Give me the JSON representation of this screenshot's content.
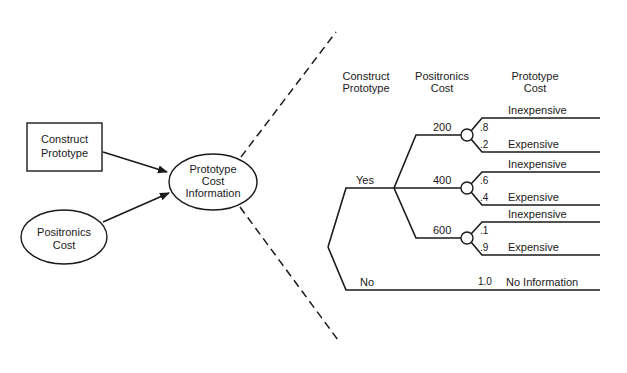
{
  "influence_diagram": {
    "decision_node": {
      "label_line1": "Construct",
      "label_line2": "Prototype"
    },
    "uncertainty_node_positronics": {
      "label_line1": "Positronics",
      "label_line2": "Cost"
    },
    "uncertainty_node_info": {
      "label_line1": "Prototype",
      "label_line2": "Cost",
      "label_line3": "Information"
    }
  },
  "decision_tree": {
    "headers": {
      "construct_prototype": {
        "line1": "Construct",
        "line2": "Prototype"
      },
      "positronics_cost": {
        "line1": "Positronics",
        "line2": "Cost"
      },
      "prototype_cost": {
        "line1": "Prototype",
        "line2": "Cost"
      }
    },
    "construct_branches": [
      {
        "label": "Yes"
      },
      {
        "label": "No"
      }
    ],
    "positronics_branches": [
      {
        "cost": "200",
        "outcomes": [
          {
            "prob": ".8",
            "label": "Inexpensive"
          },
          {
            "prob": ".2",
            "label": "Expensive"
          }
        ]
      },
      {
        "cost": "400",
        "outcomes": [
          {
            "prob": ".6",
            "label": "Inexpensive"
          },
          {
            "prob": ".4",
            "label": "Expensive"
          }
        ]
      },
      {
        "cost": "600",
        "outcomes": [
          {
            "prob": ".1",
            "label": "Inexpensive"
          },
          {
            "prob": ".9",
            "label": "Expensive"
          }
        ]
      }
    ],
    "no_branch_outcome": {
      "prob": "1.0",
      "label": "No Information"
    }
  }
}
